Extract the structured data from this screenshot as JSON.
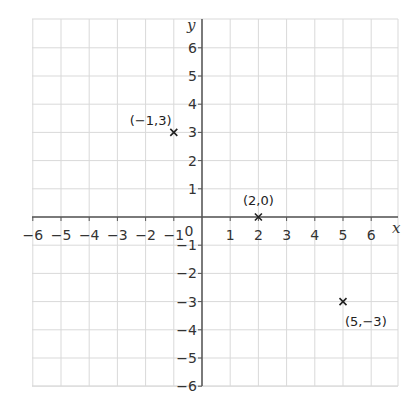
{
  "chart_data": {
    "type": "scatter",
    "title": "",
    "xlabel": "x",
    "ylabel": "y",
    "xlim": [
      -6,
      6.9
    ],
    "ylim": [
      -6,
      6.9
    ],
    "grid": true,
    "origin_label": "0",
    "x_ticks": [
      -6,
      -5,
      -4,
      -3,
      -2,
      -1,
      1,
      2,
      3,
      4,
      5,
      6
    ],
    "x_tick_labels": [
      "−6",
      "−5",
      "−4",
      "−3",
      "−2",
      "−1",
      "1",
      "2",
      "3",
      "4",
      "5",
      "6"
    ],
    "y_ticks": [
      6,
      5,
      4,
      3,
      2,
      1,
      -1,
      -2,
      -3,
      -4,
      -5,
      -6
    ],
    "y_tick_labels": [
      "6",
      "5",
      "4",
      "3",
      "2",
      "1",
      "−1",
      "−2",
      "−3",
      "−4",
      "−5",
      "−6"
    ],
    "points": [
      {
        "x": -1,
        "y": 3,
        "label": "(−1,3)",
        "marker": "×"
      },
      {
        "x": 2,
        "y": 0,
        "label": "(2,0)",
        "marker": "×"
      },
      {
        "x": 5,
        "y": -3,
        "label": "(5,−3)",
        "marker": "×"
      }
    ]
  },
  "style": {
    "grid_color": "#d9d9d9",
    "axis_color": "#555555",
    "marker_color": "#222222"
  }
}
